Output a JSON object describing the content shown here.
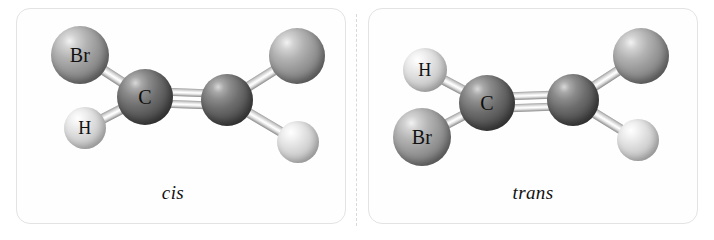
{
  "figure": {
    "background_color": "#ffffff",
    "panel_border_color": "#e3e3e3",
    "divider_color": "#d9d9d9"
  },
  "panels": [
    {
      "id": "cis",
      "caption": "cis",
      "molecule": {
        "name": "cis-1,2-dibromoethene",
        "atoms": [
          {
            "element": "Br",
            "label": "Br",
            "show_label": true,
            "cx": 80,
            "cy": 55,
            "r": 29,
            "color": "#9a9a9a",
            "font_size": 20
          },
          {
            "element": "H",
            "label": "H",
            "show_label": true,
            "cx": 85,
            "cy": 128,
            "r": 21,
            "color": "#d6d6d6",
            "font_size": 18
          },
          {
            "element": "C",
            "label": "C",
            "show_label": true,
            "cx": 145,
            "cy": 97,
            "r": 28,
            "color": "#5a5a5a",
            "font_size": 20
          },
          {
            "element": "C",
            "label": "C",
            "show_label": false,
            "cx": 227,
            "cy": 100,
            "r": 26,
            "color": "#5a5a5a",
            "font_size": 20
          },
          {
            "element": "Br",
            "label": "Br",
            "show_label": false,
            "cx": 297,
            "cy": 56,
            "r": 28,
            "color": "#9a9a9a",
            "font_size": 20
          },
          {
            "element": "H",
            "label": "H",
            "show_label": false,
            "cx": 298,
            "cy": 142,
            "r": 21,
            "color": "#d6d6d6",
            "font_size": 18
          }
        ],
        "bonds": [
          {
            "from": 0,
            "to": 2,
            "order": 1,
            "thickness": 10
          },
          {
            "from": 1,
            "to": 2,
            "order": 1,
            "thickness": 10
          },
          {
            "from": 2,
            "to": 3,
            "order": 2,
            "thickness": 8,
            "separation": 12
          },
          {
            "from": 3,
            "to": 4,
            "order": 1,
            "thickness": 10
          },
          {
            "from": 3,
            "to": 5,
            "order": 1,
            "thickness": 10
          }
        ]
      }
    },
    {
      "id": "trans",
      "caption": "trans",
      "molecule": {
        "name": "trans-1,2-dibromoethene",
        "atoms": [
          {
            "element": "H",
            "label": "H",
            "show_label": true,
            "cx": 425,
            "cy": 70,
            "r": 22,
            "color": "#d6d6d6",
            "font_size": 18
          },
          {
            "element": "Br",
            "label": "Br",
            "show_label": true,
            "cx": 422,
            "cy": 137,
            "r": 29,
            "color": "#9a9a9a",
            "font_size": 20
          },
          {
            "element": "C",
            "label": "C",
            "show_label": true,
            "cx": 487,
            "cy": 103,
            "r": 28,
            "color": "#5a5a5a",
            "font_size": 20
          },
          {
            "element": "C",
            "label": "C",
            "show_label": false,
            "cx": 573,
            "cy": 100,
            "r": 26,
            "color": "#5a5a5a",
            "font_size": 20
          },
          {
            "element": "Br",
            "label": "Br",
            "show_label": false,
            "cx": 641,
            "cy": 56,
            "r": 28,
            "color": "#9a9a9a",
            "font_size": 20
          },
          {
            "element": "H",
            "label": "H",
            "show_label": false,
            "cx": 638,
            "cy": 140,
            "r": 21,
            "color": "#d6d6d6",
            "font_size": 18
          }
        ],
        "bonds": [
          {
            "from": 0,
            "to": 2,
            "order": 1,
            "thickness": 10
          },
          {
            "from": 1,
            "to": 2,
            "order": 1,
            "thickness": 10
          },
          {
            "from": 2,
            "to": 3,
            "order": 2,
            "thickness": 8,
            "separation": 12
          },
          {
            "from": 3,
            "to": 4,
            "order": 1,
            "thickness": 10
          },
          {
            "from": 3,
            "to": 5,
            "order": 1,
            "thickness": 10
          }
        ]
      }
    }
  ]
}
